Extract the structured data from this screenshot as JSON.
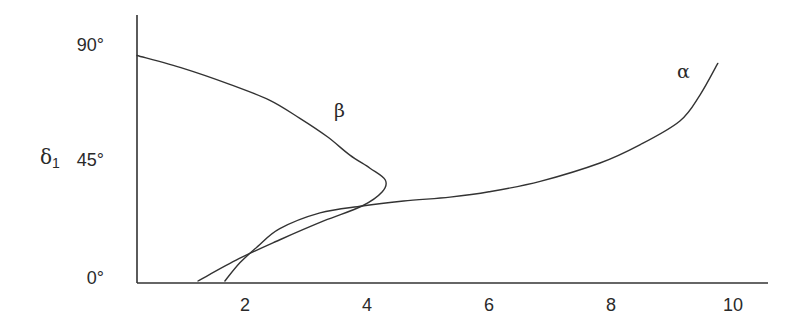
{
  "chart_data": {
    "type": "line",
    "title": "",
    "xlabel": "",
    "ylabel": "δ1",
    "ylabel_main": "δ",
    "ylabel_sub": "1",
    "xlim": [
      0.23,
      10.6
    ],
    "ylim": [
      0,
      90
    ],
    "grid": false,
    "legend": "none (curves labelled inline)",
    "x_ticks": [
      {
        "value": 2,
        "label": "2"
      },
      {
        "value": 4,
        "label": "4"
      },
      {
        "value": 6,
        "label": "6"
      },
      {
        "value": 8,
        "label": "8"
      },
      {
        "value": 10,
        "label": "10"
      }
    ],
    "y_ticks": [
      {
        "value": 0,
        "label": "0°"
      },
      {
        "value": 45,
        "label": "45°"
      },
      {
        "value": 90,
        "label": "90°"
      }
    ],
    "series": [
      {
        "name": "β",
        "label": "β",
        "label_position": {
          "x": 3.6,
          "y": 68
        },
        "points": [
          [
            0.23,
            86
          ],
          [
            1.0,
            81
          ],
          [
            1.75,
            75
          ],
          [
            2.4,
            69
          ],
          [
            2.9,
            62
          ],
          [
            3.35,
            55
          ],
          [
            3.72,
            48
          ],
          [
            4.05,
            43
          ],
          [
            4.3,
            38.5
          ],
          [
            4.25,
            34
          ],
          [
            3.92,
            28.6
          ],
          [
            3.3,
            23
          ],
          [
            2.6,
            16
          ],
          [
            1.9,
            8.5
          ],
          [
            1.23,
            0
          ]
        ]
      },
      {
        "name": "α",
        "label": "α",
        "label_position": {
          "x": 9.2,
          "y": 80
        },
        "points": [
          [
            1.67,
            0
          ],
          [
            1.92,
            7
          ],
          [
            2.2,
            13
          ],
          [
            2.57,
            20
          ],
          [
            3.23,
            26
          ],
          [
            3.92,
            28.6
          ],
          [
            4.6,
            30.5
          ],
          [
            5.36,
            32
          ],
          [
            6.0,
            34
          ],
          [
            6.84,
            38
          ],
          [
            7.82,
            45
          ],
          [
            8.48,
            52
          ],
          [
            9.13,
            61
          ],
          [
            9.46,
            71
          ],
          [
            9.75,
            83
          ]
        ]
      }
    ]
  }
}
